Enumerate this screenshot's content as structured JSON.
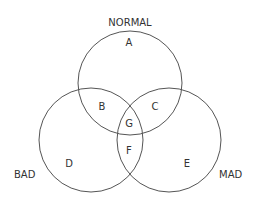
{
  "title": "NORMAL",
  "sets": [
    {
      "name": "NORMAL",
      "cx": 130,
      "cy": 83,
      "r": 52
    },
    {
      "name": "BAD",
      "cx": 91,
      "cy": 143,
      "r": 52
    },
    {
      "name": "MAD",
      "cx": 169,
      "cy": 143,
      "r": 52
    }
  ],
  "set_labels": {
    "normal": "NORMAL",
    "bad": "BAD",
    "mad": "MAD"
  },
  "regions": {
    "a": "A",
    "b": "B",
    "c": "C",
    "d": "D",
    "e": "E",
    "f": "F",
    "g": "G"
  },
  "colors": {
    "stroke": "#555555",
    "text": "#333333",
    "background": "#ffffff"
  }
}
